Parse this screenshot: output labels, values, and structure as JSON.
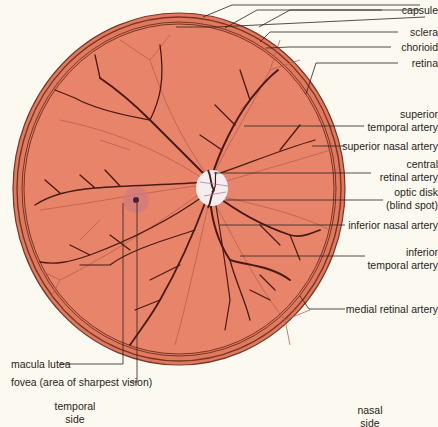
{
  "colors": {
    "background": "#fbf9f0",
    "fundus": "#e8846a",
    "ring_outer": "#e07a5f",
    "ring_line": "#7a3526",
    "artery_dark": "#4a1a14",
    "vein_light": "#b8604e",
    "optic_disk": "#f5eef0",
    "macula": "#d07a80",
    "leader": "#2a2420"
  },
  "labels": {
    "capsule": "capsule",
    "sclera": "sclera",
    "chorioid": "chorioid",
    "retina": "retina",
    "superior_temporal_artery": [
      "superior",
      "temporal artery"
    ],
    "superior_nasal_artery": "superior nasal artery",
    "central_retinal_artery": [
      "central",
      "retinal artery"
    ],
    "optic_disk": [
      "optic disk",
      "(blind spot)"
    ],
    "inferior_nasal_artery": "inferior nasal artery",
    "inferior_temporal_artery": [
      "inferior",
      "temporal artery"
    ],
    "medial_retinal_artery": "medial retinal artery",
    "macula_lutea": "macula lutea",
    "fovea": "fovea (area of sharpest vision)",
    "temporal_side": [
      "temporal",
      "side"
    ],
    "nasal_side": [
      "nasal",
      "side"
    ]
  }
}
